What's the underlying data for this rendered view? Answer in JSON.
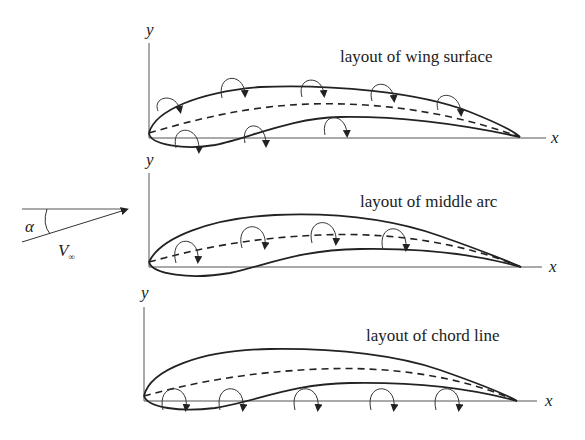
{
  "diagram": {
    "freestream": {
      "angle_label": "α",
      "velocity_label": "V∞",
      "velocity_main": "V",
      "velocity_sub": "∞"
    },
    "panels": [
      {
        "title": "layout of wing surface",
        "x_axis_label": "x",
        "y_axis_label": "y",
        "vortex_placement": "on upper and lower surfaces",
        "vortex_count": 8
      },
      {
        "title": "layout of middle arc",
        "x_axis_label": "x",
        "y_axis_label": "y",
        "vortex_placement": "on mean camber line",
        "vortex_count": 4
      },
      {
        "title": "layout of chord line",
        "x_axis_label": "x",
        "y_axis_label": "y",
        "vortex_placement": "on chord line (x-axis)",
        "vortex_count": 5
      }
    ],
    "colors": {
      "line": "#222222",
      "axis": "#555555",
      "background": "#ffffff"
    }
  }
}
